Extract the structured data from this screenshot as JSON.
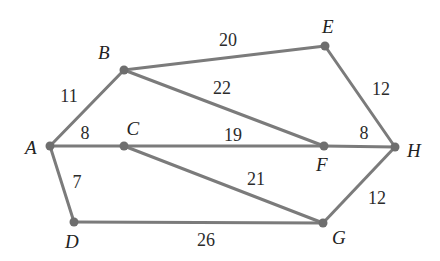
{
  "figure": {
    "kind": "weighted-undirected-graph",
    "width": 440,
    "height": 261,
    "background_color": "#ffffff",
    "edge_color": "#7b7b7b",
    "node_color": "#6e6e6e",
    "label_color": "#222222",
    "edge_width": 3,
    "node_radius": 4.5
  },
  "chart_data": {
    "type": "diagram",
    "title": "",
    "nodes": [
      {
        "id": "A",
        "label": "A",
        "x": 50,
        "y": 146,
        "label_x": 31,
        "label_y": 147
      },
      {
        "id": "B",
        "label": "B",
        "x": 124,
        "y": 70,
        "label_x": 104,
        "label_y": 52
      },
      {
        "id": "C",
        "label": "C",
        "x": 124,
        "y": 146,
        "label_x": 133,
        "label_y": 128
      },
      {
        "id": "D",
        "label": "D",
        "x": 74,
        "y": 222,
        "label_x": 72,
        "label_y": 241
      },
      {
        "id": "E",
        "label": "E",
        "x": 325,
        "y": 46,
        "label_x": 328,
        "label_y": 26
      },
      {
        "id": "F",
        "label": "F",
        "x": 324,
        "y": 146,
        "label_x": 322,
        "label_y": 164
      },
      {
        "id": "G",
        "label": "G",
        "x": 323,
        "y": 223,
        "label_x": 339,
        "label_y": 237
      },
      {
        "id": "H",
        "label": "H",
        "x": 395,
        "y": 147,
        "label_x": 414,
        "label_y": 150
      }
    ],
    "edges": [
      {
        "from": "A",
        "to": "B",
        "weight": 11,
        "label": "11",
        "label_x": 69,
        "label_y": 96
      },
      {
        "from": "A",
        "to": "C",
        "weight": 8,
        "label": "8",
        "label_x": 85,
        "label_y": 133
      },
      {
        "from": "A",
        "to": "D",
        "weight": 7,
        "label": "7",
        "label_x": 77,
        "label_y": 182
      },
      {
        "from": "B",
        "to": "E",
        "weight": 20,
        "label": "20",
        "label_x": 228,
        "label_y": 40
      },
      {
        "from": "B",
        "to": "F",
        "weight": 22,
        "label": "22",
        "label_x": 222,
        "label_y": 88
      },
      {
        "from": "C",
        "to": "F",
        "weight": 19,
        "label": "19",
        "label_x": 233,
        "label_y": 135
      },
      {
        "from": "C",
        "to": "G",
        "weight": 21,
        "label": "21",
        "label_x": 256,
        "label_y": 179
      },
      {
        "from": "D",
        "to": "G",
        "weight": 26,
        "label": "26",
        "label_x": 206,
        "label_y": 240
      },
      {
        "from": "E",
        "to": "H",
        "weight": 12,
        "label": "12",
        "label_x": 381,
        "label_y": 89
      },
      {
        "from": "F",
        "to": "H",
        "weight": 8,
        "label": "8",
        "label_x": 364,
        "label_y": 133
      },
      {
        "from": "G",
        "to": "H",
        "weight": 12,
        "label": "12",
        "label_x": 377,
        "label_y": 198
      }
    ]
  }
}
